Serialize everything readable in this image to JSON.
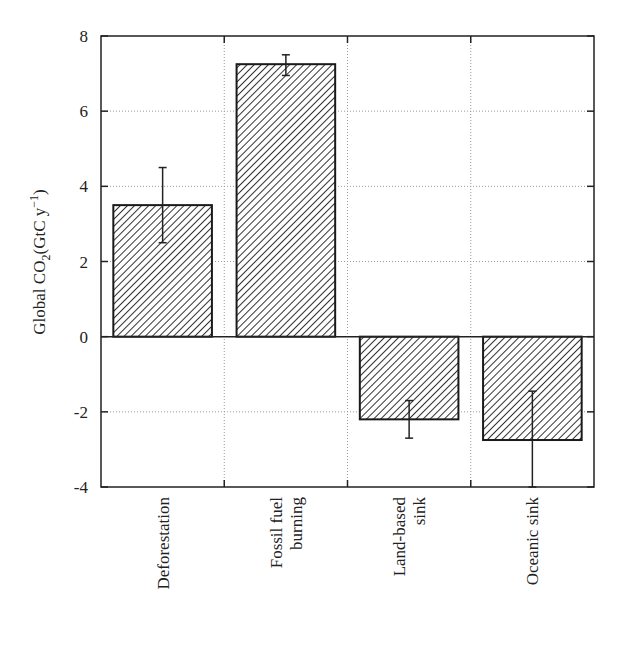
{
  "chart_data": {
    "type": "bar",
    "title": "",
    "xlabel": "",
    "ylabel": "Global CO2(GtC y-1)",
    "ylabel_parts": {
      "main": "Global CO",
      "sub": "2",
      "mid": "(GtC y",
      "sup": "−1",
      "end": ")"
    },
    "categories": [
      "Deforestation",
      "Fossil fuel burning",
      "Land-based sink",
      "Oceanic sink"
    ],
    "category_lines": [
      [
        "Deforestation"
      ],
      [
        "Fossil fuel",
        "burning"
      ],
      [
        "Land-based",
        "sink"
      ],
      [
        "Oceanic sink"
      ]
    ],
    "values": [
      3.5,
      7.25,
      -2.2,
      -2.75
    ],
    "error_low": [
      2.5,
      6.95,
      -2.7,
      -4.0
    ],
    "error_high": [
      4.5,
      7.5,
      -1.7,
      -1.45
    ],
    "ylim": [
      -4,
      8
    ],
    "yticks": [
      -4,
      -2,
      0,
      2,
      4,
      6,
      8
    ],
    "ytick_labels": [
      "-4",
      "-2",
      "0",
      "2",
      "4",
      "6",
      "8"
    ],
    "grid": true,
    "bar_fill": "diagonal-hatch",
    "colors": {
      "bar_edge": "#1a1a1a",
      "hatch": "#333333",
      "grid": "#999999",
      "axis": "#222222"
    }
  }
}
